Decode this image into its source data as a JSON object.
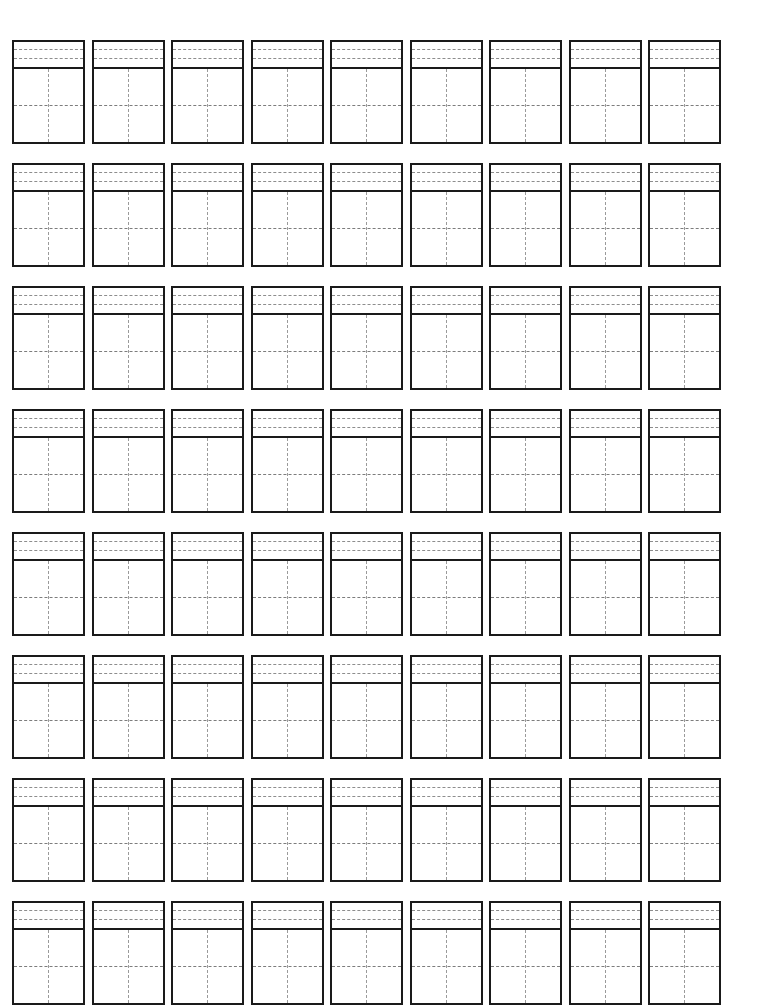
{
  "page": {
    "background_color": "#ffffff",
    "width": 757,
    "height": 982
  },
  "worksheet": {
    "type": "blank-practice-grid",
    "rows": 8,
    "columns": 9,
    "total_cells": 72,
    "cell": {
      "pinyin_section": {
        "guide_line_count": 2,
        "guide_line_style": "dashed",
        "guide_line_color": "#8d8d8d",
        "border_color": "#1a1a1a"
      },
      "character_square": {
        "cross_lines": [
          "vertical-center",
          "horizontal-center"
        ],
        "cross_line_style": "dashed",
        "cross_line_color": "#9a9a9a",
        "border_color": "#1a1a1a"
      }
    },
    "content": "",
    "rows_data": [
      {
        "index": 1,
        "cells": [
          "",
          "",
          "",
          "",
          "",
          "",
          "",
          "",
          ""
        ]
      },
      {
        "index": 2,
        "cells": [
          "",
          "",
          "",
          "",
          "",
          "",
          "",
          "",
          ""
        ]
      },
      {
        "index": 3,
        "cells": [
          "",
          "",
          "",
          "",
          "",
          "",
          "",
          "",
          ""
        ]
      },
      {
        "index": 4,
        "cells": [
          "",
          "",
          "",
          "",
          "",
          "",
          "",
          "",
          ""
        ]
      },
      {
        "index": 5,
        "cells": [
          "",
          "",
          "",
          "",
          "",
          "",
          "",
          "",
          ""
        ]
      },
      {
        "index": 6,
        "cells": [
          "",
          "",
          "",
          "",
          "",
          "",
          "",
          "",
          ""
        ]
      },
      {
        "index": 7,
        "cells": [
          "",
          "",
          "",
          "",
          "",
          "",
          "",
          "",
          ""
        ]
      },
      {
        "index": 8,
        "cells": [
          "",
          "",
          "",
          "",
          "",
          "",
          "",
          "",
          ""
        ]
      }
    ]
  }
}
